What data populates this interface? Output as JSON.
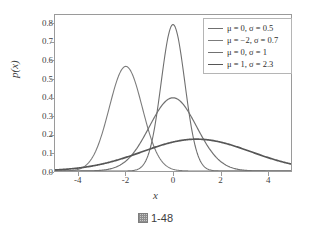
{
  "caption": {
    "glyph_icon": "figure-box-glyph",
    "text": "1-48"
  },
  "chart_data": {
    "type": "line",
    "title": "",
    "xlabel": "x",
    "ylabel": "p(x)",
    "xlim": [
      -5,
      5
    ],
    "ylim": [
      0.0,
      0.85
    ],
    "grid": false,
    "legend_position": "upper-right",
    "x_ticks": [
      "-4",
      "-2",
      "0",
      "2",
      "4"
    ],
    "x_tick_values": [
      -4,
      -2,
      0,
      2,
      4
    ],
    "y_ticks": [
      "0.0",
      "0.1",
      "0.2",
      "0.3",
      "0.4",
      "0.5",
      "0.6",
      "0.7",
      "0.8"
    ],
    "y_tick_values": [
      0.0,
      0.1,
      0.2,
      0.3,
      0.4,
      0.5,
      0.6,
      0.7,
      0.8
    ],
    "series": [
      {
        "name": "μ = 0, σ = 0.5",
        "mu": 0,
        "sigma": 0.5,
        "peak_x": 0,
        "peak_y": 0.798,
        "color": "#6f6f6f",
        "width": 1.1
      },
      {
        "name": "μ = −2, σ = 0.7",
        "mu": -2,
        "sigma": 0.7,
        "peak_x": -2,
        "peak_y": 0.57,
        "color": "#7c7c7c",
        "width": 1.1
      },
      {
        "name": "μ = 0, σ = 1",
        "mu": 0,
        "sigma": 1,
        "peak_x": 0,
        "peak_y": 0.399,
        "color": "#717171",
        "width": 1.2
      },
      {
        "name": "μ = 1, σ = 2.3",
        "mu": 1,
        "sigma": 2.3,
        "peak_x": 1,
        "peak_y": 0.173,
        "color": "#565656",
        "width": 1.7
      }
    ],
    "legend_entries": [
      "μ = 0, σ = 0.5",
      "μ = −2, σ = 0.7",
      "μ = 0, σ = 1",
      "μ = 1, σ = 2.3"
    ]
  }
}
